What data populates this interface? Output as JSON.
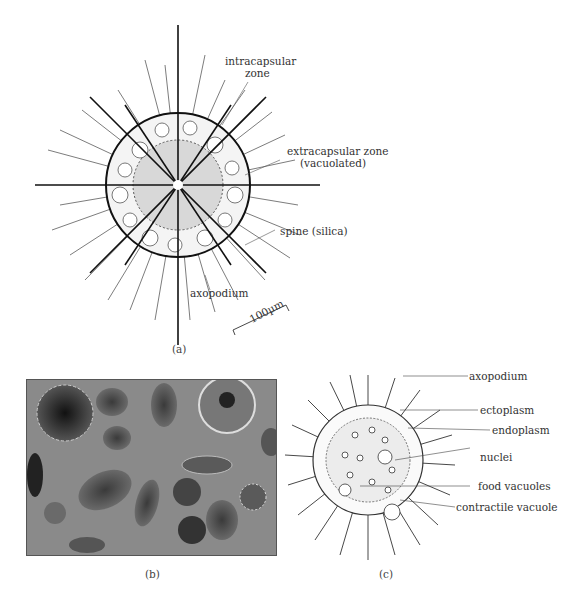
{
  "figure": {
    "panel_a": {
      "caption": "(a)",
      "labels": {
        "intracapsular_line1": "intracapsular",
        "intracapsular_line2": "zone",
        "extracapsular_line1": "extracapsular zone",
        "extracapsular_line2": "(vacuolated)",
        "spine": "spine (silica)",
        "axopodium": "axopodium"
      },
      "scale_bar": "100µm"
    },
    "panel_b": {
      "caption": "(b)",
      "content": "micrograph of radiolarian shells",
      "background_color": "#8a8a8a"
    },
    "panel_c": {
      "caption": "(c)",
      "labels": {
        "axopodium": "axopodium",
        "ectoplasm": "ectoplasm",
        "endoplasm": "endoplasm",
        "nuclei": "nuclei",
        "food_vacuoles": "food vacuoles",
        "contractile_vacuole": "contractile vacuole"
      }
    }
  }
}
